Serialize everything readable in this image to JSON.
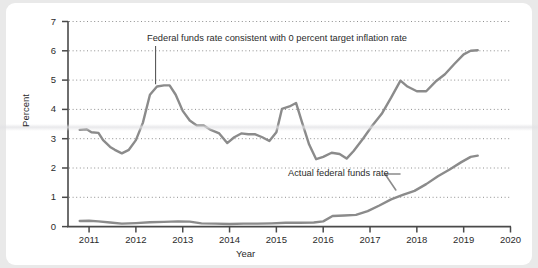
{
  "chart_data": {
    "type": "line",
    "title": "",
    "xlabel": "Year",
    "ylabel": "Percent",
    "xlim": [
      2010.55,
      2020.0
    ],
    "ylim": [
      0,
      7
    ],
    "xticks": [
      "2011",
      "2012",
      "2013",
      "2014",
      "2015",
      "2016",
      "2017",
      "2018",
      "2019",
      "2020"
    ],
    "yticks": [
      "0",
      "1",
      "2",
      "3",
      "4",
      "5",
      "6",
      "7"
    ],
    "grid": "horizontal-dotted",
    "legend": "inline-annotations",
    "line_color": "#8b8b8b",
    "axis_color": "#4a4a4a",
    "grid_color": "#8f8f8f",
    "series": [
      {
        "name": "Federal funds rate consistent with 0 percent target inflation rate",
        "x": [
          2010.8,
          2010.95,
          2011.05,
          2011.2,
          2011.3,
          2011.45,
          2011.55,
          2011.7,
          2011.85,
          2012.0,
          2012.15,
          2012.3,
          2012.45,
          2012.6,
          2012.72,
          2012.85,
          2013.0,
          2013.15,
          2013.3,
          2013.45,
          2013.6,
          2013.78,
          2013.95,
          2014.1,
          2014.25,
          2014.4,
          2014.55,
          2014.7,
          2014.85,
          2015.0,
          2015.12,
          2015.28,
          2015.42,
          2015.55,
          2015.7,
          2015.85,
          2016.0,
          2016.18,
          2016.35,
          2016.5,
          2016.65,
          2016.85,
          2017.05,
          2017.25,
          2017.45,
          2017.65,
          2017.8,
          2018.0,
          2018.2,
          2018.4,
          2018.6,
          2018.8,
          2019.0,
          2019.15,
          2019.3
        ],
        "y": [
          3.3,
          3.32,
          3.22,
          3.2,
          2.95,
          2.72,
          2.62,
          2.5,
          2.62,
          2.95,
          3.55,
          4.5,
          4.78,
          4.82,
          4.82,
          4.5,
          3.95,
          3.62,
          3.45,
          3.45,
          3.3,
          3.18,
          2.85,
          3.05,
          3.18,
          3.15,
          3.15,
          3.05,
          2.92,
          3.22,
          4.02,
          4.1,
          4.22,
          3.55,
          2.8,
          2.3,
          2.38,
          2.52,
          2.48,
          2.32,
          2.58,
          3.0,
          3.45,
          3.85,
          4.4,
          4.98,
          4.78,
          4.62,
          4.62,
          4.95,
          5.2,
          5.55,
          5.88,
          6.0,
          6.02
        ]
      },
      {
        "name": "Actual federal funds rate",
        "x": [
          2010.8,
          2011.0,
          2011.2,
          2011.45,
          2011.7,
          2012.0,
          2012.3,
          2012.6,
          2012.9,
          2013.15,
          2013.4,
          2013.7,
          2014.0,
          2014.3,
          2014.6,
          2014.9,
          2015.2,
          2015.5,
          2015.8,
          2016.0,
          2016.2,
          2016.45,
          2016.7,
          2016.95,
          2017.2,
          2017.45,
          2017.7,
          2017.95,
          2018.2,
          2018.45,
          2018.7,
          2018.95,
          2019.15,
          2019.3
        ],
        "y": [
          0.19,
          0.2,
          0.18,
          0.14,
          0.1,
          0.12,
          0.15,
          0.16,
          0.18,
          0.17,
          0.11,
          0.1,
          0.09,
          0.1,
          0.1,
          0.11,
          0.13,
          0.13,
          0.14,
          0.18,
          0.36,
          0.38,
          0.4,
          0.53,
          0.72,
          0.93,
          1.08,
          1.22,
          1.45,
          1.72,
          1.95,
          2.2,
          2.38,
          2.42
        ]
      }
    ],
    "annotations": [
      {
        "text": "Federal funds rate consistent with 0 percent target inflation rate",
        "pointer": "vertical-line",
        "points_to_x": 2012.42,
        "points_to_y": 4.82
      },
      {
        "text": "Actual federal funds rate",
        "pointer": "leader-line",
        "points_to_x": 2017.55,
        "points_to_y": 1.25
      }
    ]
  }
}
